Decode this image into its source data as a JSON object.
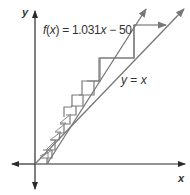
{
  "diagram": {
    "type": "cobweb",
    "axes": {
      "x_label": "x",
      "y_label": "y"
    },
    "function_label": "f(x) = 1.031x − 50",
    "function_label_parts": {
      "name": "f",
      "arg": "x",
      "rhs_pre": " = 1.031",
      "var": "x",
      "rhs_post": " − 50"
    },
    "identity_label_parts": {
      "lhs": "y",
      "eq": " = ",
      "rhs": "x"
    },
    "identity_label": "y = x",
    "colors": {
      "axis": "#2a2a2a",
      "curve": "#707070",
      "cobweb": "#7a7a7a",
      "text": "#333333"
    }
  }
}
